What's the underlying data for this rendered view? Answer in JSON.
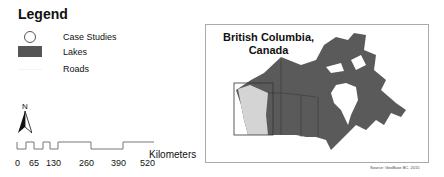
{
  "legend": {
    "title": "Legend",
    "items": [
      {
        "symbol": "circle-outline",
        "label": "Case Studies"
      },
      {
        "symbol": "filled-rect",
        "label": "Lakes",
        "color": "#555555"
      },
      {
        "symbol": "line",
        "label": "Roads",
        "color": "#f3f3f3"
      }
    ]
  },
  "north_arrow": {
    "label": "N"
  },
  "scale_bar": {
    "ticks": [
      "0",
      "65",
      "130",
      "260",
      "390",
      "520"
    ],
    "unit": "Kilometers"
  },
  "inset_map": {
    "title_line1": "British Columbia,",
    "title_line2": "Canada",
    "land_color": "#5a5a5a",
    "highlight_color": "#d4d4d4",
    "frame_color": "#aaaaaa"
  },
  "source": "Source: GeoBase BC, 2015"
}
